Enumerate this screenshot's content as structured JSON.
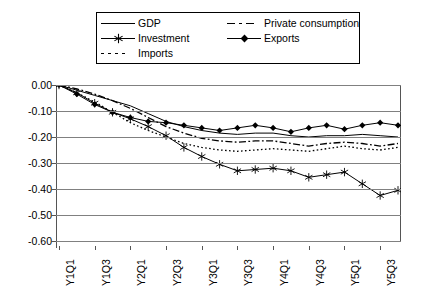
{
  "chart_data": {
    "type": "line",
    "title": "",
    "xlabel": "",
    "ylabel": "",
    "ylim": [
      -0.6,
      0.0
    ],
    "yticks": [
      "0.00",
      "-0.10",
      "-0.20",
      "-0.30",
      "-0.40",
      "-0.50",
      "-0.60"
    ],
    "ytick_values": [
      0.0,
      -0.1,
      -0.2,
      -0.3,
      -0.4,
      -0.5,
      -0.6
    ],
    "grid": true,
    "legend_position": "top",
    "x": [
      "Y1Q1",
      "Y1Q2",
      "Y1Q3",
      "Y1Q4",
      "Y2Q1",
      "Y2Q2",
      "Y2Q3",
      "Y2Q4",
      "Y3Q1",
      "Y3Q2",
      "Y3Q3",
      "Y3Q4",
      "Y4Q1",
      "Y4Q2",
      "Y4Q3",
      "Y4Q4",
      "Y5Q1",
      "Y5Q2",
      "Y5Q3",
      "Y5Q4"
    ],
    "xtick_labels": [
      "Y1Q1",
      "Y1Q3",
      "Y2Q1",
      "Y2Q3",
      "Y3Q1",
      "Y3Q3",
      "Y4Q1",
      "Y4Q3",
      "Y5Q1",
      "Y5Q3"
    ],
    "series": [
      {
        "name": "GDP",
        "style": "solid",
        "marker": "none",
        "color": "#000000",
        "values": [
          0.0,
          -0.02,
          -0.04,
          -0.06,
          -0.08,
          -0.11,
          -0.14,
          -0.16,
          -0.175,
          -0.185,
          -0.19,
          -0.185,
          -0.185,
          -0.195,
          -0.2,
          -0.195,
          -0.195,
          -0.19,
          -0.195,
          -0.2
        ]
      },
      {
        "name": "Investment",
        "style": "solid",
        "marker": "asterisk",
        "color": "#000000",
        "values": [
          0.0,
          -0.03,
          -0.07,
          -0.105,
          -0.13,
          -0.16,
          -0.195,
          -0.24,
          -0.275,
          -0.305,
          -0.33,
          -0.325,
          -0.32,
          -0.33,
          -0.355,
          -0.345,
          -0.335,
          -0.38,
          -0.425,
          -0.405
        ]
      },
      {
        "name": "Imports",
        "style": "dotted",
        "marker": "none",
        "color": "#000000",
        "values": [
          0.0,
          -0.03,
          -0.065,
          -0.105,
          -0.145,
          -0.175,
          -0.2,
          -0.225,
          -0.24,
          -0.25,
          -0.255,
          -0.25,
          -0.245,
          -0.25,
          -0.255,
          -0.245,
          -0.235,
          -0.245,
          -0.25,
          -0.24
        ]
      },
      {
        "name": "Private consumption",
        "style": "dashdot",
        "marker": "none",
        "color": "#000000",
        "values": [
          0.0,
          -0.015,
          -0.035,
          -0.06,
          -0.09,
          -0.125,
          -0.16,
          -0.185,
          -0.205,
          -0.215,
          -0.22,
          -0.215,
          -0.215,
          -0.225,
          -0.235,
          -0.225,
          -0.22,
          -0.225,
          -0.235,
          -0.225
        ]
      },
      {
        "name": "Exports",
        "style": "solid",
        "marker": "diamond",
        "color": "#000000",
        "values": [
          0.0,
          -0.035,
          -0.075,
          -0.105,
          -0.125,
          -0.14,
          -0.145,
          -0.155,
          -0.165,
          -0.175,
          -0.165,
          -0.155,
          -0.165,
          -0.18,
          -0.165,
          -0.155,
          -0.17,
          -0.155,
          -0.145,
          -0.155
        ]
      }
    ]
  },
  "legend": {
    "entries": [
      {
        "label": "GDP",
        "key": "line-solid-icon"
      },
      {
        "label": "Investment",
        "key": "line-asterisk-icon"
      },
      {
        "label": "Imports",
        "key": "line-dotted-icon"
      },
      {
        "label": "Private consumption",
        "key": "line-dashdot-icon"
      },
      {
        "label": "Exports",
        "key": "line-diamond-icon"
      }
    ]
  },
  "colors": {
    "axis": "#555555",
    "grid": "#808080",
    "series": "#000000",
    "background": "#ffffff"
  }
}
